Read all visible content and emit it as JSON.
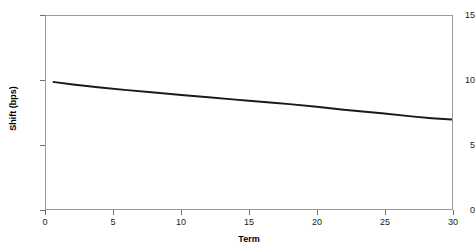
{
  "chart_data": {
    "type": "line",
    "title": "",
    "xlabel": "Term",
    "ylabel": "Shift (bps)",
    "xlim": [
      0,
      30
    ],
    "ylim": [
      0,
      15
    ],
    "xticks": [
      0,
      5,
      10,
      15,
      20,
      25,
      30
    ],
    "yticks": [
      0,
      5,
      10,
      15
    ],
    "xtick_labels": [
      "0",
      "5",
      "10",
      "15",
      "20",
      "25",
      "30"
    ],
    "ytick_labels": [
      "0",
      "5",
      "10",
      "15"
    ],
    "grid": false,
    "legend": false,
    "legend_position": "none",
    "series": [
      {
        "name": "Shift",
        "color": "#1a1a1a",
        "line_width": 2,
        "x": [
          0.5,
          2,
          4,
          6,
          8,
          10,
          12,
          14,
          15,
          17,
          18,
          20,
          22,
          23,
          25,
          27,
          28.5,
          30
        ],
        "y": [
          9.88,
          9.68,
          9.45,
          9.24,
          9.05,
          8.86,
          8.68,
          8.5,
          8.42,
          8.24,
          8.15,
          7.95,
          7.72,
          7.62,
          7.42,
          7.2,
          7.06,
          6.95
        ]
      }
    ]
  },
  "axes": {
    "x_title": "Term",
    "y_title": "Shift (bps)"
  },
  "style": {
    "background": "#ffffff",
    "border_color": "#9a9a9a",
    "tick_color": "#6e6e6e",
    "text_color": "#1a1a1a",
    "line_color": "#1a1a1a"
  }
}
